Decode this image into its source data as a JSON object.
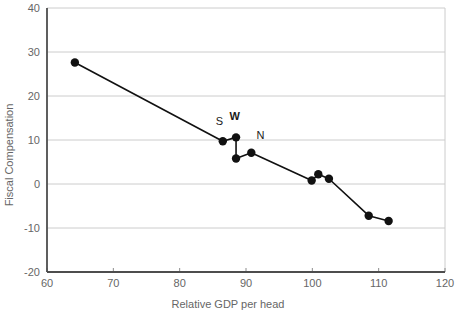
{
  "chart_data": {
    "type": "line",
    "title": "",
    "xlabel": "Relative GDP per head",
    "ylabel": "Fiscal Compensation",
    "xlim": [
      60,
      120
    ],
    "ylim": [
      -20,
      40
    ],
    "xticks": [
      60,
      70,
      80,
      90,
      100,
      110,
      120
    ],
    "yticks": [
      -20,
      -10,
      0,
      10,
      20,
      30,
      40
    ],
    "xtick_labels": [
      "60",
      "70",
      "80",
      "90",
      "100",
      "110",
      "120"
    ],
    "ytick_labels": [
      "-20",
      "-10",
      "0",
      "10",
      "20",
      "30",
      "40"
    ],
    "grid": "horizontal",
    "legend": "none",
    "marker": "filled-circle",
    "series": [
      {
        "name": "Fiscal Compensation vs Relative GDP per head",
        "points": [
          {
            "x": 64.2,
            "y": 27.6,
            "label": ""
          },
          {
            "x": 86.5,
            "y": 9.7,
            "label": "S"
          },
          {
            "x": 88.5,
            "y": 10.6,
            "label": "W"
          },
          {
            "x": 88.5,
            "y": 5.8,
            "label": ""
          },
          {
            "x": 90.8,
            "y": 7.1,
            "label": "N"
          },
          {
            "x": 99.9,
            "y": 0.8,
            "label": ""
          },
          {
            "x": 100.9,
            "y": 2.2,
            "label": ""
          },
          {
            "x": 102.5,
            "y": 1.2,
            "label": ""
          },
          {
            "x": 108.5,
            "y": -7.2,
            "label": ""
          },
          {
            "x": 111.5,
            "y": -8.4,
            "label": ""
          }
        ]
      }
    ],
    "annotations": [
      {
        "text": "S",
        "x": 86.0,
        "y": 13.3,
        "bold": false
      },
      {
        "text": "W",
        "x": 88.3,
        "y": 14.6,
        "bold": true
      },
      {
        "text": "N",
        "x": 92.2,
        "y": 10.3,
        "bold": false
      }
    ],
    "colors": {
      "marker": "#111111",
      "line": "#111111",
      "grid": "#cccccc",
      "axis": "#555555",
      "text": "#666666"
    }
  },
  "caption": {
    "text": ""
  }
}
